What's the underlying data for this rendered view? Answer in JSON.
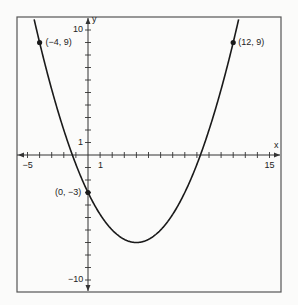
{
  "chart_data": {
    "type": "line",
    "title": "",
    "xlabel": "x",
    "ylabel": "y",
    "xlim": [
      -5,
      15
    ],
    "ylim": [
      -10,
      10
    ],
    "grid": false,
    "function": "y = 0.25(x - 4)^2 - 7",
    "series": [
      {
        "name": "parabola",
        "vertex": [
          4,
          -7
        ]
      }
    ],
    "points": [
      {
        "x": -4,
        "y": 9,
        "label": "(−4, 9)"
      },
      {
        "x": 12,
        "y": 9,
        "label": "(12, 9)"
      },
      {
        "x": 0,
        "y": -3,
        "label": "(0, −3)"
      }
    ],
    "tick_labels": {
      "x": [
        {
          "v": -5,
          "t": "−5"
        },
        {
          "v": 1,
          "t": "1"
        },
        {
          "v": 15,
          "t": "15"
        }
      ],
      "y": [
        {
          "v": 10,
          "t": "10"
        },
        {
          "v": 1,
          "t": "1"
        },
        {
          "v": -10,
          "t": "−10"
        }
      ]
    }
  },
  "colors": {
    "line": "#1a1a1a",
    "frame": "#555555",
    "background": "#fbfbfa"
  }
}
